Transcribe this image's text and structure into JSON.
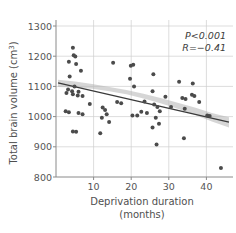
{
  "chart_data": {
    "type": "scatter",
    "title": "",
    "xlabel": "Deprivation duration (months)",
    "xlabel_line1": "Deprivation duration",
    "xlabel_line2": "(months)",
    "ylabel": "Total brain volume (cm3)",
    "ylabel_main": "Total brain volume (cm",
    "ylabel_sup": "3",
    "ylabel_close": ")",
    "xlim": [
      0,
      44
    ],
    "ylim": [
      800,
      1300
    ],
    "xticks": [
      10,
      20,
      30,
      40
    ],
    "xtick_labels": [
      "10",
      "20",
      "30",
      "40"
    ],
    "yticks": [
      800,
      900,
      1000,
      1100,
      1200,
      1300
    ],
    "ytick_labels": [
      "800",
      "900",
      "1000",
      "1100",
      "1200",
      "1300"
    ],
    "grid": true,
    "legend": "none",
    "annotations": [
      {
        "name": "p-value",
        "text": "P<0.001"
      },
      {
        "name": "correlation",
        "text": "R=−0.41"
      }
    ],
    "point_color": "#4b4b4b",
    "line_color": "#3a3a3a",
    "band_color": "#b4b4b4",
    "grid_color": "#cfcfcf",
    "axis_color": "#8a8a8a",
    "regression": {
      "x_start": 0.5,
      "y_start": 1112,
      "x_end": 43,
      "y_end": 982,
      "ci_upper": [
        1122,
        1116,
        1108,
        1098,
        1088,
        1076,
        1062,
        1046,
        1030,
        1012,
        998
      ],
      "ci_lower": [
        1098,
        1096,
        1092,
        1084,
        1074,
        1060,
        1044,
        1026,
        1006,
        984,
        964
      ],
      "ci_x": [
        0.5,
        4.75,
        9.0,
        13.25,
        17.5,
        21.75,
        26.0,
        30.25,
        34.5,
        38.75,
        43.0
      ]
    },
    "points": [
      {
        "x": 4.2,
        "y": 1228
      },
      {
        "x": 3.2,
        "y": 1182
      },
      {
        "x": 4.4,
        "y": 1203
      },
      {
        "x": 4.8,
        "y": 1199
      },
      {
        "x": 5.0,
        "y": 1174
      },
      {
        "x": 6.2,
        "y": 1152
      },
      {
        "x": 3.4,
        "y": 1133
      },
      {
        "x": 4.6,
        "y": 1100
      },
      {
        "x": 3.0,
        "y": 1090
      },
      {
        "x": 4.0,
        "y": 1084
      },
      {
        "x": 5.6,
        "y": 1082
      },
      {
        "x": 2.6,
        "y": 1078
      },
      {
        "x": 4.2,
        "y": 1074
      },
      {
        "x": 5.4,
        "y": 1070
      },
      {
        "x": 6.6,
        "y": 1068
      },
      {
        "x": 2.4,
        "y": 1018
      },
      {
        "x": 3.2,
        "y": 1014
      },
      {
        "x": 5.6,
        "y": 1012
      },
      {
        "x": 6.6,
        "y": 1008
      },
      {
        "x": 4.2,
        "y": 951
      },
      {
        "x": 5.0,
        "y": 950
      },
      {
        "x": 8.4,
        "y": 1042
      },
      {
        "x": 11.6,
        "y": 1030
      },
      {
        "x": 12.2,
        "y": 1022
      },
      {
        "x": 11.4,
        "y": 996
      },
      {
        "x": 12.6,
        "y": 1008
      },
      {
        "x": 13.2,
        "y": 982
      },
      {
        "x": 11.0,
        "y": 945
      },
      {
        "x": 14.2,
        "y": 1178
      },
      {
        "x": 15.2,
        "y": 1048
      },
      {
        "x": 16.2,
        "y": 1044
      },
      {
        "x": 18.6,
        "y": 1168
      },
      {
        "x": 19.2,
        "y": 1172
      },
      {
        "x": 18.4,
        "y": 1125
      },
      {
        "x": 19.4,
        "y": 1100
      },
      {
        "x": 19.0,
        "y": 1004
      },
      {
        "x": 20.2,
        "y": 1004
      },
      {
        "x": 22.0,
        "y": 1050
      },
      {
        "x": 21.2,
        "y": 1016
      },
      {
        "x": 22.6,
        "y": 1012
      },
      {
        "x": 24.2,
        "y": 1140
      },
      {
        "x": 24.0,
        "y": 1084
      },
      {
        "x": 24.4,
        "y": 1040
      },
      {
        "x": 25.2,
        "y": 1032
      },
      {
        "x": 25.8,
        "y": 1018
      },
      {
        "x": 24.8,
        "y": 996
      },
      {
        "x": 25.6,
        "y": 976
      },
      {
        "x": 24.0,
        "y": 964
      },
      {
        "x": 25.0,
        "y": 908
      },
      {
        "x": 27.2,
        "y": 1066
      },
      {
        "x": 28.6,
        "y": 1032
      },
      {
        "x": 30.6,
        "y": 1115
      },
      {
        "x": 31.4,
        "y": 1062
      },
      {
        "x": 32.2,
        "y": 1058
      },
      {
        "x": 32.0,
        "y": 1026
      },
      {
        "x": 31.8,
        "y": 928
      },
      {
        "x": 34.0,
        "y": 1110
      },
      {
        "x": 33.8,
        "y": 1072
      },
      {
        "x": 34.4,
        "y": 1068
      },
      {
        "x": 35.6,
        "y": 1048
      },
      {
        "x": 37.6,
        "y": 1004
      },
      {
        "x": 38.2,
        "y": 1002
      },
      {
        "x": 41.0,
        "y": 830
      }
    ]
  }
}
